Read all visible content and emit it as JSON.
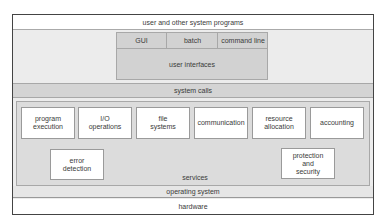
{
  "diagram": {
    "top_layer": "user and other system programs",
    "user_interfaces": {
      "items": [
        "GUI",
        "batch",
        "command line"
      ],
      "label": "user interfaces"
    },
    "system_calls": "system calls",
    "services": {
      "label": "services",
      "row1": [
        "program\nexecution",
        "I/O\noperations",
        "file\nsystems",
        "communication",
        "resource\nallocation",
        "accounting"
      ],
      "error_detection": "error\ndetection",
      "protection": "protection\nand\nsecurity"
    },
    "operating_system": "operating system",
    "hardware": "hardware"
  }
}
